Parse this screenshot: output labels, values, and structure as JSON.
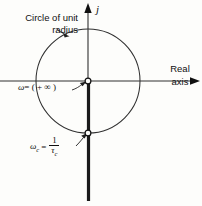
{
  "figure": {
    "background_color": "#fdfdfb",
    "stroke_color": "#101010",
    "labels": {
      "circle_caption": "Circle of unit radius",
      "real_axis_line1": "Real",
      "real_axis_line2": "axis",
      "imaginary_axis": "j",
      "omega_infinity": "ω = ( + ∞ )",
      "omega_infinity_symbol": "ω",
      "omega_infinity_value": "= ( + ∞ )",
      "omega_c_symbol": "ω",
      "omega_c_subscript": "c",
      "omega_c_equals": "=",
      "omega_c_numerator": "1",
      "omega_c_denominator_symbol": "τ",
      "omega_c_denominator_subscript": "c"
    },
    "geometry": {
      "circle_center_x": 88,
      "circle_center_y": 81,
      "circle_radius": 52,
      "origin_x": 88,
      "origin_y": 81,
      "real_axis_y": 81,
      "imag_axis_x": 88,
      "marker_origin": {
        "x": 88,
        "y": 81,
        "type": "open-circle"
      },
      "marker_omega_c": {
        "x": 88,
        "y": 133,
        "type": "open-circle"
      },
      "locus_top_y": 81,
      "locus_bottom_y": 201
    }
  }
}
